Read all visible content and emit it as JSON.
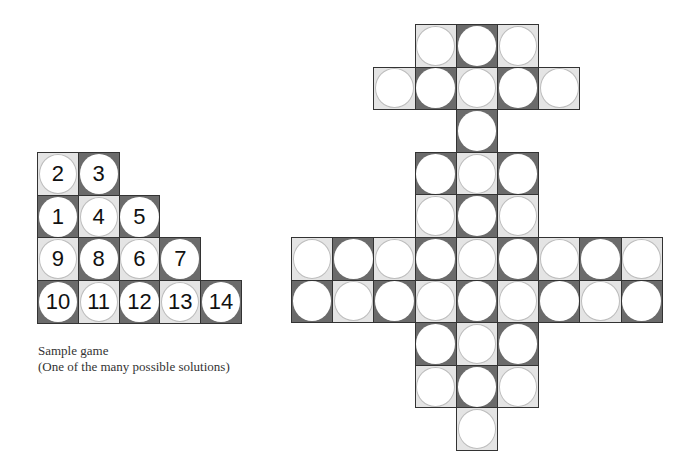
{
  "sample_board": {
    "origin": [
      37,
      152
    ],
    "cell_w": 40.8,
    "cell_h": 42.7,
    "light_parity": 0,
    "rows": [
      [
        "2",
        "3"
      ],
      [
        "1",
        "4",
        "5"
      ],
      [
        "9",
        "8",
        "6",
        "7"
      ],
      [
        "10",
        "11",
        "12",
        "13",
        "14"
      ]
    ]
  },
  "caption": {
    "line1": "Sample game",
    "line2": "(One of the many possible solutions)"
  },
  "puzzle_board": {
    "origin": [
      291,
      24
    ],
    "cell_w": 41.2,
    "cell_h": 42.6,
    "light_parity": 1,
    "rows": [
      [
        3,
        4,
        5
      ],
      [
        2,
        3,
        4,
        5,
        6
      ],
      [
        4
      ],
      [
        3,
        4,
        5
      ],
      [
        3,
        4,
        5
      ],
      [
        0,
        1,
        2,
        3,
        4,
        5,
        6,
        7,
        8
      ],
      [
        0,
        1,
        2,
        3,
        4,
        5,
        6,
        7,
        8
      ],
      [
        3,
        4,
        5
      ],
      [
        3,
        4,
        5
      ],
      [
        4
      ]
    ]
  },
  "colors": {
    "light_cell": "#e4e4e4",
    "dark_cell": "#6b6b6b",
    "circle": "#ffffff",
    "border": "#333333"
  }
}
